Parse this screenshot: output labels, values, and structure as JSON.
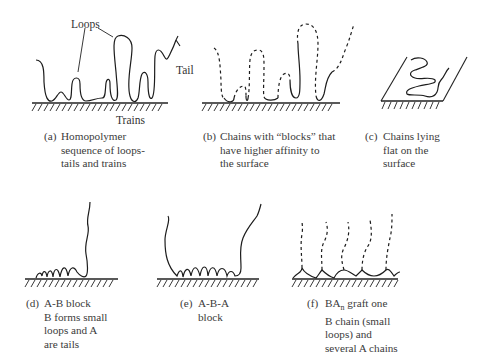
{
  "figure": {
    "type": "polymer adsorption conformations diagram",
    "panels": [
      {
        "id": "a",
        "tag": "(a)",
        "caption_lines": [
          "Homopolymer",
          "sequence of loops-",
          "tails and trains"
        ],
        "labels": {
          "loops": "Loops",
          "tail": "Tail",
          "trains": "Trains"
        }
      },
      {
        "id": "b",
        "tag": "(b)",
        "caption_lines": [
          "Chains with “blocks” that",
          "have higher affinity to",
          "the surface"
        ]
      },
      {
        "id": "c",
        "tag": "(c)",
        "caption_lines": [
          "Chains lying",
          "flat on the",
          "surface"
        ]
      },
      {
        "id": "d",
        "tag": "(d)",
        "caption_lines": [
          "A-B block",
          "B forms small",
          "loops and A",
          "are tails"
        ]
      },
      {
        "id": "e",
        "tag": "(e)",
        "caption_lines": [
          "A-B-A",
          "block"
        ]
      },
      {
        "id": "f",
        "tag": "(f)",
        "caption_lines_rich": [
          {
            "pre": "BA",
            "sub": "n",
            "post": " graft one"
          },
          {
            "pre": "B chain (small",
            "sub": "",
            "post": ""
          },
          {
            "pre": "loops) and",
            "sub": "",
            "post": ""
          },
          {
            "pre": "several A chains",
            "sub": "",
            "post": ""
          }
        ]
      }
    ]
  }
}
